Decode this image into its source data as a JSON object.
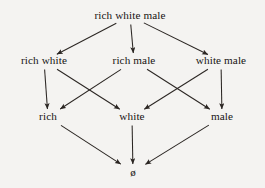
{
  "diagram": {
    "type": "hasse-lattice",
    "background_color": "#f4f3f1",
    "line_color": "#2b2623",
    "text_color": "#171412",
    "levels": 4,
    "nodes": [
      {
        "id": "rich-white-male",
        "label": "rich white male",
        "level": 0,
        "x": 130,
        "y": 16
      },
      {
        "id": "rich-white",
        "label": "rich white",
        "level": 1,
        "x": 44,
        "y": 61
      },
      {
        "id": "rich-male",
        "label": "rich male",
        "level": 1,
        "x": 134,
        "y": 61
      },
      {
        "id": "white-male",
        "label": "white male",
        "level": 1,
        "x": 221,
        "y": 61
      },
      {
        "id": "rich",
        "label": "rich",
        "level": 2,
        "x": 48,
        "y": 117
      },
      {
        "id": "white",
        "label": "white",
        "level": 2,
        "x": 132,
        "y": 117
      },
      {
        "id": "male",
        "label": "male",
        "level": 2,
        "x": 222,
        "y": 117
      },
      {
        "id": "empty-set",
        "label": "ø",
        "level": 3,
        "x": 133,
        "y": 172
      }
    ],
    "edges": [
      {
        "from": "rich-white-male",
        "to": "rich-white"
      },
      {
        "from": "rich-white-male",
        "to": "rich-male"
      },
      {
        "from": "rich-white-male",
        "to": "white-male"
      },
      {
        "from": "rich-white",
        "to": "rich"
      },
      {
        "from": "rich-white",
        "to": "white"
      },
      {
        "from": "rich-male",
        "to": "rich"
      },
      {
        "from": "rich-male",
        "to": "male"
      },
      {
        "from": "white-male",
        "to": "white"
      },
      {
        "from": "white-male",
        "to": "male"
      },
      {
        "from": "rich",
        "to": "empty-set"
      },
      {
        "from": "white",
        "to": "empty-set"
      },
      {
        "from": "male",
        "to": "empty-set"
      }
    ]
  }
}
